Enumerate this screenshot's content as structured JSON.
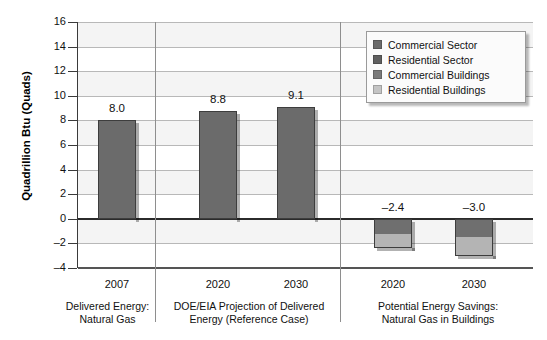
{
  "chart_data": {
    "type": "bar",
    "title": "",
    "xlabel": "",
    "ylabel": "Quadrillion Btu (Quads)",
    "ylim": [
      -4,
      16
    ],
    "ytick_values": [
      16,
      14,
      12,
      10,
      8,
      6,
      4,
      2,
      0,
      -2,
      -4
    ],
    "ytick_labels": [
      "16",
      "14",
      "12",
      "10",
      "8",
      "6",
      "4",
      "2",
      "0",
      "-2",
      "-4"
    ],
    "grid": true,
    "legend_position": "top-right",
    "categories": [
      "2007",
      "2020",
      "2030",
      "2020",
      "2030"
    ],
    "bars": [
      {
        "category": "2007",
        "group": "Delivered Energy: Natural Gas",
        "total": 8.0,
        "label": "8.0",
        "stacked": false,
        "segments": [
          {
            "series": "Commercial Sector",
            "value": 8.0,
            "color": "#6b6b6b"
          }
        ]
      },
      {
        "category": "2020",
        "group": "DOE/EIA Projection of Delivered Energy (Reference Case)",
        "total": 8.8,
        "label": "8.8",
        "stacked": false,
        "segments": [
          {
            "series": "Commercial Sector",
            "value": 8.8,
            "color": "#6b6b6b"
          }
        ]
      },
      {
        "category": "2030",
        "group": "DOE/EIA Projection of Delivered Energy (Reference Case)",
        "total": 9.1,
        "label": "9.1",
        "stacked": false,
        "segments": [
          {
            "series": "Commercial Sector",
            "value": 9.1,
            "color": "#6b6b6b"
          }
        ]
      },
      {
        "category": "2020",
        "group": "Potential Energy Savings: Natural Gas in Buildings",
        "total": -2.4,
        "label": "–2.4",
        "stacked": true,
        "segments": [
          {
            "series": "Commercial Buildings",
            "value": -1.2,
            "color": "#6f6f6f"
          },
          {
            "series": "Residential Buildings",
            "value": -1.2,
            "color": "#b4b4b4"
          }
        ]
      },
      {
        "category": "2030",
        "group": "Potential Energy Savings: Natural Gas in Buildings",
        "total": -3.0,
        "label": "–3.0",
        "stacked": true,
        "segments": [
          {
            "series": "Commercial Buildings",
            "value": -1.5,
            "color": "#6f6f6f"
          },
          {
            "series": "Residential Buildings",
            "value": -1.5,
            "color": "#b4b4b4"
          }
        ]
      }
    ],
    "series": [
      {
        "name": "Commercial Sector",
        "color": "#6b6b6b",
        "values": [
          8.0,
          8.8,
          9.1,
          null,
          null
        ]
      },
      {
        "name": "Residential Sector",
        "color": "#5f5f5f",
        "values": [
          null,
          null,
          null,
          null,
          null
        ]
      },
      {
        "name": "Commercial Buildings",
        "color": "#7a7a7a",
        "values": [
          null,
          null,
          null,
          -1.2,
          -1.5
        ]
      },
      {
        "name": "Residential Buildings",
        "color": "#c4c4c4",
        "values": [
          null,
          null,
          null,
          -1.2,
          -1.5
        ]
      }
    ],
    "groups": [
      {
        "caption_line1": "Delivered Energy:",
        "caption_line2": "Natural Gas"
      },
      {
        "caption_line1": "DOE/EIA Projection of Delivered",
        "caption_line2": "Energy (Reference Case)"
      },
      {
        "caption_line1": "Potential Energy Savings:",
        "caption_line2": "Natural Gas in Buildings"
      }
    ]
  },
  "legend": {
    "entries": [
      {
        "label": "Commercial Sector",
        "color": "#6b6b6b"
      },
      {
        "label": "Residential Sector",
        "color": "#5f5f5f"
      },
      {
        "label": "Commercial Buildings",
        "color": "#7a7a7a"
      },
      {
        "label": "Residential Buildings",
        "color": "#c4c4c4"
      }
    ]
  }
}
